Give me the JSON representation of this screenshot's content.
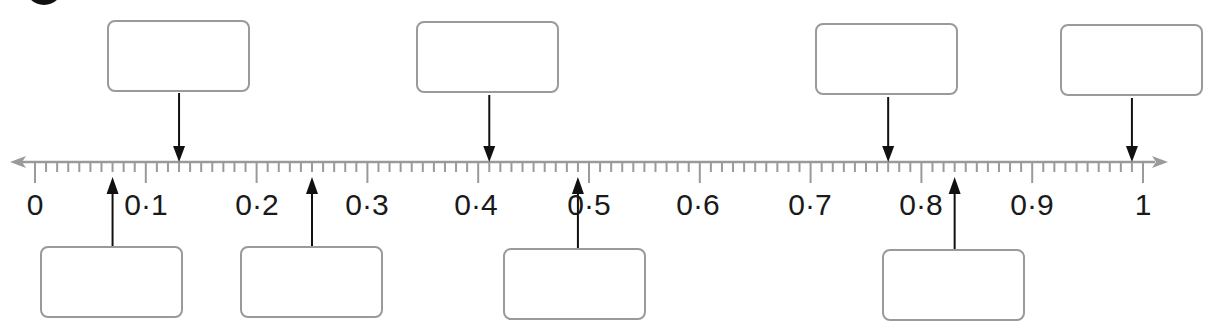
{
  "worksheet": {
    "question_badge": "",
    "number_line": {
      "min": 0,
      "max": 1,
      "major_step": 0.1,
      "minor_step": 0.01,
      "labels": [
        "0",
        "0·1",
        "0·2",
        "0·3",
        "0·4",
        "0·5",
        "0·6",
        "0·7",
        "0·8",
        "0·9",
        "1"
      ],
      "axis_color": "#9a9a9a",
      "arrow_color": "#111111",
      "box_border_color": "#9a9a9a"
    },
    "answer_boxes_top": [
      {
        "points_to": 0.13,
        "value": ""
      },
      {
        "points_to": 0.41,
        "value": ""
      },
      {
        "points_to": 0.77,
        "value": ""
      },
      {
        "points_to": 0.99,
        "value": ""
      }
    ],
    "answer_boxes_bottom": [
      {
        "points_to": 0.07,
        "value": ""
      },
      {
        "points_to": 0.25,
        "value": ""
      },
      {
        "points_to": 0.49,
        "value": ""
      },
      {
        "points_to": 0.83,
        "value": ""
      }
    ]
  }
}
